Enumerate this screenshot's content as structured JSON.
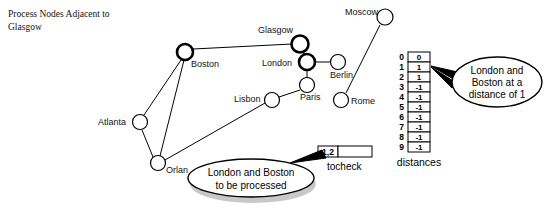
{
  "caption": {
    "line1": "Process Nodes Adjacent to",
    "line2": "Glasgow"
  },
  "graph": {
    "nodes": [
      {
        "id": 0,
        "name": "Glasgow",
        "label": "Glasgow",
        "cx": 300,
        "cy": 44,
        "r": 8.5,
        "highlight": true,
        "label_x": 258,
        "label_y": 33,
        "anchor": "start"
      },
      {
        "id": 1,
        "name": "London",
        "label": "London",
        "cx": 307,
        "cy": 62,
        "r": 8.0,
        "highlight": true,
        "label_x": 262,
        "label_y": 66,
        "anchor": "start"
      },
      {
        "id": 2,
        "name": "Boston",
        "label": "Boston",
        "cx": 185,
        "cy": 52,
        "r": 8.0,
        "highlight": true,
        "label_x": 191,
        "label_y": 67,
        "anchor": "start"
      },
      {
        "id": 3,
        "name": "Berlin",
        "label": "Berlin",
        "cx": 338,
        "cy": 62,
        "r": 7.5,
        "highlight": false,
        "label_x": 330,
        "label_y": 78,
        "anchor": "start"
      },
      {
        "id": 4,
        "name": "Paris",
        "label": "Paris",
        "cx": 307,
        "cy": 85,
        "r": 7.5,
        "highlight": false,
        "label_x": 300,
        "label_y": 100,
        "anchor": "start"
      },
      {
        "id": 5,
        "name": "Lisbon",
        "label": "Lisbon",
        "cx": 272,
        "cy": 100,
        "r": 7.5,
        "highlight": false,
        "label_x": 234,
        "label_y": 102,
        "anchor": "start"
      },
      {
        "id": 6,
        "name": "Moscow",
        "label": "Moscow",
        "cx": 385,
        "cy": 17,
        "r": 8.0,
        "highlight": false,
        "label_x": 345,
        "label_y": 15,
        "anchor": "start"
      },
      {
        "id": 7,
        "name": "Rome",
        "label": "Rome",
        "cx": 341,
        "cy": 100,
        "r": 7.5,
        "highlight": false,
        "label_x": 351,
        "label_y": 104,
        "anchor": "start"
      },
      {
        "id": 8,
        "name": "Atlanta",
        "label": "Atlanta",
        "cx": 140,
        "cy": 122,
        "r": 7.5,
        "highlight": false,
        "label_x": 98,
        "label_y": 125,
        "anchor": "start"
      },
      {
        "id": 9,
        "name": "Orlando",
        "label": "Orlan",
        "cx": 158,
        "cy": 163,
        "r": 7.5,
        "highlight": false,
        "label_x": 166,
        "label_y": 173,
        "anchor": "start"
      }
    ],
    "edges": [
      {
        "from": "Boston",
        "to": "Glasgow"
      },
      {
        "from": "London",
        "to": "Glasgow"
      },
      {
        "from": "London",
        "to": "Berlin"
      },
      {
        "from": "London",
        "to": "Paris"
      },
      {
        "from": "Paris",
        "to": "Lisbon"
      },
      {
        "from": "Moscow",
        "to": "Rome"
      },
      {
        "from": "Boston",
        "to": "Atlanta"
      },
      {
        "from": "Boston",
        "to": "Orlando"
      },
      {
        "from": "Atlanta",
        "to": "Orlando"
      },
      {
        "from": "Orlando",
        "to": "Lisbon"
      }
    ]
  },
  "distances": {
    "caption": "distances",
    "indices": [
      "0",
      "1",
      "2",
      "3",
      "4",
      "5",
      "6",
      "7",
      "8",
      "9"
    ],
    "values": [
      "0",
      "1",
      "1",
      "-1",
      "-1",
      "-1",
      "-1",
      "-1",
      "-1",
      "-1"
    ]
  },
  "tocheck": {
    "label": "tocheck",
    "cells": [
      "1,2"
    ]
  },
  "callouts": {
    "distance": {
      "line1": "London and",
      "line2": "Boston at a",
      "line3": "distance of 1"
    },
    "process": {
      "line1": "London and Boston",
      "line2": "to be processed"
    }
  },
  "colors": {
    "ink": "#000000",
    "paper": "#ffffff",
    "shadow": "#9a9a9a"
  }
}
